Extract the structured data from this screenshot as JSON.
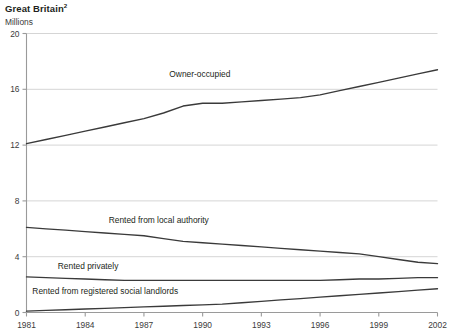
{
  "header": {
    "title": "Great Britain",
    "title_superscript": "2",
    "units": "Millions"
  },
  "chart_data": {
    "type": "line",
    "title": "Great Britain",
    "subtitle": "Millions",
    "xlabel": "",
    "ylabel": "Millions",
    "xlim": [
      1981,
      2002
    ],
    "ylim": [
      0,
      20
    ],
    "yticks": [
      "0",
      "4",
      "8",
      "12",
      "16",
      "20"
    ],
    "ytick_values": [
      0,
      4,
      8,
      12,
      16,
      20
    ],
    "xticks": [
      "1981",
      "1984",
      "1987",
      "1990",
      "1993",
      "1996",
      "1999",
      "2002"
    ],
    "xtick_values": [
      1981,
      1984,
      1987,
      1990,
      1993,
      1996,
      1999,
      2002
    ],
    "grid": "horizontal",
    "legend": "inline-labels",
    "line_color": "#3a3a3a",
    "grid_color": "#d5d5d5",
    "axis_color": "#9a9a9a",
    "x": [
      1981,
      1982,
      1983,
      1984,
      1985,
      1986,
      1987,
      1988,
      1989,
      1990,
      1991,
      1992,
      1993,
      1994,
      1995,
      1996,
      1997,
      1998,
      1999,
      2000,
      2001,
      2002
    ],
    "series": [
      {
        "name": "Owner-occupied",
        "label": "Owner-occupied",
        "label_x": 1988.3,
        "label_y": 16.9,
        "values": [
          12.1,
          12.4,
          12.7,
          13.0,
          13.3,
          13.6,
          13.9,
          14.3,
          14.8,
          15.0,
          15.0,
          15.1,
          15.2,
          15.3,
          15.4,
          15.6,
          15.9,
          16.2,
          16.5,
          16.8,
          17.1,
          17.4
        ]
      },
      {
        "name": "Rented from local authority",
        "label": "Rented from local authority",
        "label_x": 1985.2,
        "label_y": 6.4,
        "values": [
          6.1,
          6.0,
          5.9,
          5.8,
          5.7,
          5.6,
          5.5,
          5.3,
          5.1,
          5.0,
          4.9,
          4.8,
          4.7,
          4.6,
          4.5,
          4.4,
          4.3,
          4.2,
          4.0,
          3.8,
          3.6,
          3.5
        ]
      },
      {
        "name": "Rented privately",
        "label": "Rented privately",
        "label_x": 1982.6,
        "label_y": 3.1,
        "values": [
          2.55,
          2.5,
          2.45,
          2.4,
          2.35,
          2.3,
          2.3,
          2.3,
          2.3,
          2.3,
          2.3,
          2.3,
          2.3,
          2.3,
          2.3,
          2.3,
          2.35,
          2.4,
          2.4,
          2.45,
          2.5,
          2.5
        ]
      },
      {
        "name": "Rented from registered social landlords",
        "label": "Rented from registered social landlords",
        "label_x": 1981.3,
        "label_y": 1.35,
        "values": [
          0.1,
          0.15,
          0.2,
          0.25,
          0.3,
          0.35,
          0.4,
          0.45,
          0.5,
          0.55,
          0.6,
          0.7,
          0.8,
          0.9,
          1.0,
          1.1,
          1.2,
          1.3,
          1.4,
          1.5,
          1.6,
          1.7
        ]
      }
    ]
  }
}
